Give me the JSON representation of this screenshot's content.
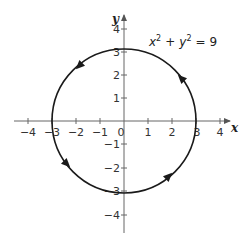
{
  "diagram": {
    "title": "",
    "equation": {
      "x_var": "x",
      "y_var": "y",
      "exp": "2",
      "plus": "+",
      "equals": "=",
      "rhs": "9",
      "full_text": "x² + y² = 9"
    },
    "axes": {
      "x_label": "x",
      "y_label": "y",
      "x_ticks": [
        "−4",
        "−3",
        "−2",
        "−1",
        "1",
        "2",
        "3",
        "4"
      ],
      "y_ticks": [
        "4",
        "3",
        "2",
        "1",
        "−1",
        "−2",
        "−3",
        "−4"
      ],
      "origin_label": "0",
      "range": [
        -4,
        4
      ]
    },
    "curve": {
      "type": "circle",
      "center": [
        0,
        0
      ],
      "radius": 3,
      "orientation": "counterclockwise",
      "arrow_count": 4
    },
    "colors": {
      "curve": "#1a1a1a",
      "axis": "#555555",
      "text": "#333333",
      "background": "#ffffff"
    }
  }
}
